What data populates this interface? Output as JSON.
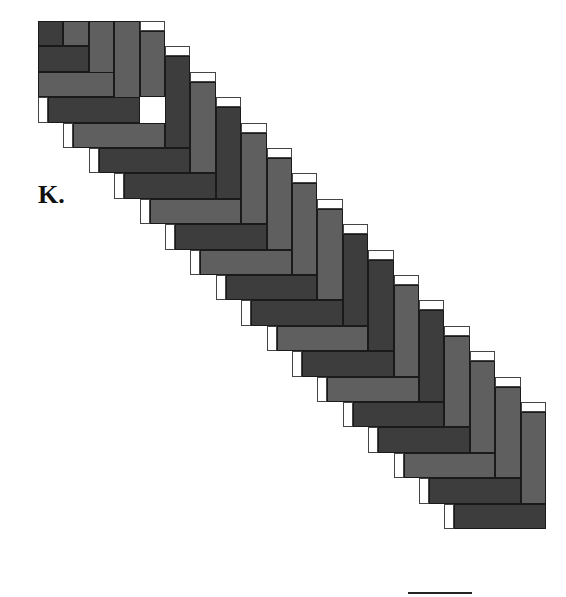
{
  "panel_label": "K.",
  "colors": {
    "dark": "#3d3d3d",
    "medium": "#5f5f5f",
    "cap": "#ffffff",
    "outline": "#1a1a1a"
  },
  "grid": {
    "origin_x": 38,
    "origin_y": 21,
    "step": 25.4,
    "cap_size": 10
  },
  "corner_block": [
    {
      "x": 0,
      "y": 0,
      "w": 1,
      "h": 1,
      "shade": "dark"
    },
    {
      "x": 1,
      "y": 0,
      "w": 1,
      "h": 1,
      "shade": "medium"
    },
    {
      "x": 2,
      "y": 0,
      "w": 1,
      "h": 3,
      "shade": "medium"
    },
    {
      "x": 3,
      "y": 0,
      "w": 1,
      "h": 4,
      "shade": "medium"
    },
    {
      "x": 0,
      "y": 1,
      "w": 2,
      "h": 1,
      "shade": "dark"
    },
    {
      "x": 0,
      "y": 2,
      "w": 3,
      "h": 1,
      "shade": "medium"
    }
  ],
  "columns": [
    "medium",
    "dark",
    "medium",
    "dark",
    "medium",
    "medium",
    "medium",
    "medium",
    "dark",
    "dark",
    "medium",
    "dark",
    "medium",
    "medium",
    "medium",
    "medium"
  ],
  "bars": [
    "dark",
    "medium",
    "dark",
    "dark",
    "medium",
    "dark",
    "medium",
    "dark",
    "dark",
    "medium",
    "dark",
    "medium",
    "dark",
    "dark",
    "medium",
    "dark",
    "dark"
  ],
  "scale_bar": {
    "length_px": 64
  }
}
